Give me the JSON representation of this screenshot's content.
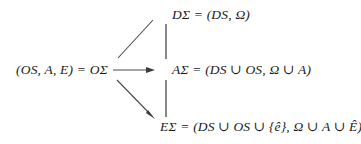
{
  "diagram": {
    "background_color": "#ffffff",
    "ink_color": "#1a1a1a",
    "nodes": {
      "top": {
        "name": "D-sigma-node",
        "text": "DΣ = (DS, Ω)"
      },
      "left": {
        "name": "O-sigma-node",
        "text": "(OS, A, E) = OΣ"
      },
      "middle": {
        "name": "A-sigma-node",
        "text": "AΣ = (DS ∪ OS, Ω ∪ A)"
      },
      "bottom": {
        "name": "E-sigma-node",
        "text": "EΣ = (DS ∪ OS ∪ {ê}, Ω ∪ A ∪ Ê)"
      }
    },
    "edges": [
      {
        "id": "edge-o-to-d",
        "label": "",
        "from": "left",
        "to": "top",
        "style": "diagonal-up-right",
        "arrowhead": false
      },
      {
        "id": "edge-o-to-a",
        "label": "",
        "from": "left",
        "to": "middle",
        "style": "horizontal-right",
        "arrowhead": true
      },
      {
        "id": "edge-o-to-e",
        "label": "",
        "from": "left",
        "to": "bottom",
        "style": "diagonal-down-right",
        "arrowhead": true
      },
      {
        "id": "edge-d-to-a",
        "label": "",
        "from": "top",
        "to": "middle",
        "style": "vertical",
        "arrowhead": false
      },
      {
        "id": "edge-a-to-e",
        "label": "",
        "from": "middle",
        "to": "bottom",
        "style": "vertical",
        "arrowhead": false
      }
    ]
  }
}
